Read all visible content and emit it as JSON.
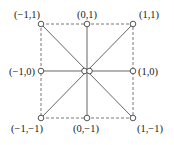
{
  "diagram": {
    "center": {
      "x": 87,
      "y": 71
    },
    "nodes": [
      {
        "id": "n_m1_1",
        "label": "(−1,1)",
        "x": 41,
        "y": 24,
        "lx": 14,
        "ly": 18
      },
      {
        "id": "n_0_1",
        "label": "(0,1)",
        "x": 87,
        "y": 24,
        "lx": 77,
        "ly": 18
      },
      {
        "id": "n_1_1",
        "label": "(1,1)",
        "x": 133,
        "y": 24,
        "lx": 139,
        "ly": 18
      },
      {
        "id": "n_m1_0",
        "label": "(−1,0)",
        "x": 41,
        "y": 71,
        "lx": 9,
        "ly": 75
      },
      {
        "id": "n_1_0",
        "label": "(1,0)",
        "x": 133,
        "y": 71,
        "lx": 138,
        "ly": 75
      },
      {
        "id": "n_m1_m1",
        "label": "(−1,−1)",
        "x": 41,
        "y": 118,
        "lx": 11,
        "ly": 132
      },
      {
        "id": "n_0_m1",
        "label": "(0,−1)",
        "x": 87,
        "y": 118,
        "lx": 73,
        "ly": 132
      },
      {
        "id": "n_1_m1",
        "label": "(1,−1)",
        "x": 133,
        "y": 118,
        "lx": 137,
        "ly": 132
      }
    ],
    "square": {
      "x1": 41,
      "y1": 24,
      "x2": 133,
      "y2": 118,
      "style": "dashed"
    },
    "colors": {
      "line": "#555555",
      "node_fill": "#ffffff",
      "node_stroke": "#444444"
    }
  }
}
